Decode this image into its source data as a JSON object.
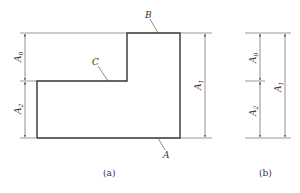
{
  "figure": {
    "panel_a": {
      "caption": "(a)",
      "labels": {
        "A": "A",
        "B": "B",
        "C": "C"
      },
      "dimensions": {
        "A0": {
          "base": "A",
          "sub": "0"
        },
        "A1": {
          "base": "A",
          "sub": "1"
        },
        "A2": {
          "base": "A",
          "sub": "2"
        }
      }
    },
    "panel_b": {
      "caption": "(b)",
      "dimensions": {
        "A0": {
          "base": "A",
          "sub": "0"
        },
        "A1": {
          "base": "A",
          "sub": "1"
        },
        "A2": {
          "base": "A",
          "sub": "2"
        }
      }
    },
    "colors": {
      "outline": "#333333",
      "thin": "#555555"
    }
  }
}
